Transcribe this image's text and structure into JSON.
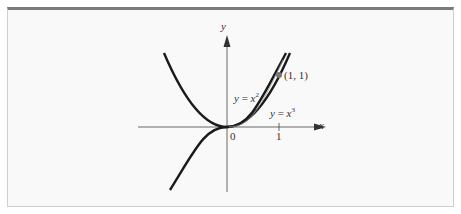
{
  "figure": {
    "axis_labels": {
      "x": "x",
      "y": "y"
    },
    "tick_labels": {
      "origin": "0",
      "x_one": "1"
    },
    "point_label": "(1, 1)",
    "curve_labels": {
      "square": {
        "lhs": "y",
        "eq": " = ",
        "var": "x",
        "exp": "2"
      },
      "cube": {
        "lhs": "y",
        "eq": " = ",
        "var": "x",
        "exp": "3"
      }
    },
    "colors": {
      "curve": "#1a1a1a",
      "axis": "#333333",
      "point": "#777777",
      "frame_top": "#7a7a7a",
      "background": "#f9f9f9"
    }
  }
}
